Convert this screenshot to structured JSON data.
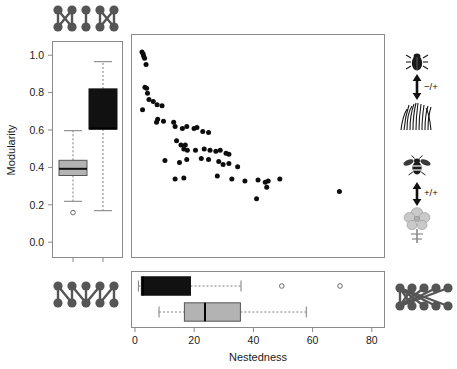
{
  "figure": {
    "background": "#ffffff",
    "colors": {
      "antagonistic_black": "#111111",
      "mutualistic_gray": "#b3b3b3",
      "point": "#0d0d0d",
      "axis": "#8a8a8a",
      "network_icon": "#555555"
    }
  },
  "axes": {
    "y": {
      "label": "Modularity",
      "ticks": [
        "0.0",
        "0.2",
        "0.4",
        "0.6",
        "0.8",
        "1.0"
      ],
      "tick_values": [
        0.0,
        0.2,
        0.4,
        0.6,
        0.8,
        1.0
      ],
      "range": [
        -0.02,
        1.06
      ]
    },
    "x": {
      "label": "Nestedness",
      "ticks": [
        "0",
        "20",
        "40",
        "60",
        "80"
      ],
      "tick_values": [
        0,
        20,
        40,
        60,
        80
      ],
      "range": [
        -3,
        84
      ]
    }
  },
  "chart_data": {
    "type": "scatter",
    "title": "",
    "xlabel": "Nestedness",
    "ylabel": "Modularity",
    "xlim": [
      -3,
      84
    ],
    "ylim": [
      -0.02,
      1.06
    ],
    "grid": false,
    "legend": "none",
    "points": [
      {
        "x": 0.6,
        "y": 0.975
      },
      {
        "x": 1.0,
        "y": 0.965
      },
      {
        "x": 1.2,
        "y": 0.955
      },
      {
        "x": 1.5,
        "y": 0.945
      },
      {
        "x": 2.0,
        "y": 0.915
      },
      {
        "x": 1.6,
        "y": 0.805
      },
      {
        "x": 2.2,
        "y": 0.8
      },
      {
        "x": 2.5,
        "y": 0.775
      },
      {
        "x": 3.0,
        "y": 0.745
      },
      {
        "x": 4.5,
        "y": 0.735
      },
      {
        "x": 5.8,
        "y": 0.72
      },
      {
        "x": 0.8,
        "y": 0.695
      },
      {
        "x": 7.5,
        "y": 0.715
      },
      {
        "x": 6.0,
        "y": 0.65
      },
      {
        "x": 5.6,
        "y": 0.635
      },
      {
        "x": 8.0,
        "y": 0.64
      },
      {
        "x": 11.5,
        "y": 0.635
      },
      {
        "x": 12.0,
        "y": 0.615
      },
      {
        "x": 14.5,
        "y": 0.605
      },
      {
        "x": 16.0,
        "y": 0.615
      },
      {
        "x": 18.5,
        "y": 0.605
      },
      {
        "x": 19.5,
        "y": 0.61
      },
      {
        "x": 21.5,
        "y": 0.59
      },
      {
        "x": 23.5,
        "y": 0.585
      },
      {
        "x": 12.5,
        "y": 0.545
      },
      {
        "x": 14.0,
        "y": 0.525
      },
      {
        "x": 15.5,
        "y": 0.525
      },
      {
        "x": 15.0,
        "y": 0.505
      },
      {
        "x": 16.2,
        "y": 0.5
      },
      {
        "x": 19.0,
        "y": 0.5
      },
      {
        "x": 22.0,
        "y": 0.505
      },
      {
        "x": 24.0,
        "y": 0.5
      },
      {
        "x": 26.0,
        "y": 0.495
      },
      {
        "x": 27.5,
        "y": 0.5
      },
      {
        "x": 29.5,
        "y": 0.485
      },
      {
        "x": 30.5,
        "y": 0.48
      },
      {
        "x": 8.5,
        "y": 0.45
      },
      {
        "x": 13.5,
        "y": 0.44
      },
      {
        "x": 16.0,
        "y": 0.455
      },
      {
        "x": 21.0,
        "y": 0.46
      },
      {
        "x": 23.5,
        "y": 0.455
      },
      {
        "x": 27.0,
        "y": 0.445
      },
      {
        "x": 28.5,
        "y": 0.43
      },
      {
        "x": 30.5,
        "y": 0.435
      },
      {
        "x": 33.5,
        "y": 0.42
      },
      {
        "x": 15.0,
        "y": 0.365
      },
      {
        "x": 12.0,
        "y": 0.36
      },
      {
        "x": 31.5,
        "y": 0.36
      },
      {
        "x": 26.5,
        "y": 0.375
      },
      {
        "x": 36.0,
        "y": 0.35
      },
      {
        "x": 40.5,
        "y": 0.355
      },
      {
        "x": 43.0,
        "y": 0.345
      },
      {
        "x": 44.0,
        "y": 0.35
      },
      {
        "x": 48.0,
        "y": 0.36
      },
      {
        "x": 43.5,
        "y": 0.32
      },
      {
        "x": 40.0,
        "y": 0.265
      },
      {
        "x": 68.5,
        "y": 0.3
      }
    ]
  },
  "left_boxplots": {
    "orientation": "vertical",
    "axis": "Modularity",
    "boxes": [
      {
        "name": "mutualistic",
        "fill": "#b3b3b3",
        "position": 1,
        "lower_whisker": 0.315,
        "q1": 0.43,
        "median": 0.478,
        "q3": 0.512,
        "upper_whisker": 0.632,
        "outliers": [
          0.265
        ]
      },
      {
        "name": "antagonistic",
        "fill": "#111111",
        "position": 2,
        "lower_whisker": 0.29,
        "q1": 0.605,
        "median": 0.608,
        "q3": 0.82,
        "upper_whisker": 0.965,
        "outliers": []
      }
    ]
  },
  "bottom_boxplots": {
    "orientation": "horizontal",
    "axis": "Nestedness",
    "boxes": [
      {
        "name": "antagonistic",
        "fill": "#111111",
        "position": 1,
        "lower_whisker": 0.5,
        "q1": 1.5,
        "median": 2.0,
        "q3": 18.5,
        "upper_whisker": 35.0,
        "outliers": [
          48.5,
          68.5
        ]
      },
      {
        "name": "mutualistic",
        "fill": "#b3b3b3",
        "position": 2,
        "lower_whisker": 7.5,
        "q1": 16.0,
        "median": 22.8,
        "q3": 34.8,
        "upper_whisker": 56.0,
        "outliers": []
      }
    ]
  },
  "icons": {
    "top_left_network": {
      "name": "modular-network-diagram",
      "description": "bipartite modular network, 5 top nodes and 5 bottom nodes in crossing modules"
    },
    "bottom_left_network": {
      "name": "intermediate-network-diagram",
      "description": "bipartite network with mixed modular and nested links"
    },
    "bottom_right_network": {
      "name": "nested-network-diagram",
      "description": "bipartite nested network, fan-shaped hub links"
    },
    "right_top": {
      "name": "antagonistic-interaction-icon",
      "top_organism": "beetle",
      "bottom_organism": "grass",
      "sign": "−/+"
    },
    "right_bottom": {
      "name": "mutualistic-interaction-icon",
      "top_organism": "bee",
      "bottom_organism": "flower",
      "sign": "+/+"
    }
  }
}
